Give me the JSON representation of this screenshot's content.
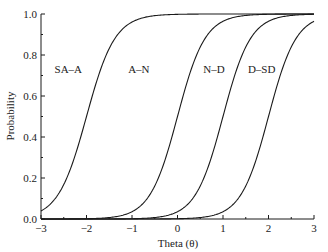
{
  "chart_data": {
    "type": "line",
    "title": "",
    "xlabel": "Theta (θ)",
    "ylabel": "Probability",
    "xlim": [
      -3,
      3
    ],
    "ylim": [
      0.0,
      1.0
    ],
    "grid": false,
    "legend": "none (inline curve labels)",
    "x_ticks": [
      "−3",
      "−2",
      "−1",
      "0",
      "1",
      "2",
      "3"
    ],
    "x_tick_values": [
      -3,
      -2,
      -1,
      0,
      1,
      2,
      3
    ],
    "y_ticks": [
      "0.0",
      "0.2",
      "0.4",
      "0.6",
      "0.8",
      "1.0"
    ],
    "y_tick_values": [
      0.0,
      0.2,
      0.4,
      0.6,
      0.8,
      1.0
    ],
    "x": [
      -3,
      -2.5,
      -2,
      -1.5,
      -1,
      -0.5,
      0,
      0.5,
      1,
      1.5,
      2,
      2.5,
      3
    ],
    "series": [
      {
        "name": "SA–A",
        "discrimination": 3.2,
        "threshold": -2.0,
        "values": [
          0.04,
          0.17,
          0.5,
          0.83,
          0.96,
          0.99,
          1.0,
          1.0,
          1.0,
          1.0,
          1.0,
          1.0,
          1.0
        ]
      },
      {
        "name": "A–N",
        "discrimination": 3.3,
        "threshold": 0.0,
        "values": [
          0.0,
          0.0,
          0.0,
          0.01,
          0.04,
          0.16,
          0.5,
          0.84,
          0.96,
          0.99,
          1.0,
          1.0,
          1.0
        ]
      },
      {
        "name": "N–D",
        "discrimination": 3.3,
        "threshold": 1.0,
        "values": [
          0.0,
          0.0,
          0.0,
          0.0,
          0.0,
          0.01,
          0.04,
          0.16,
          0.5,
          0.84,
          0.96,
          0.99,
          1.0
        ]
      },
      {
        "name": "D–SD",
        "discrimination": 3.3,
        "threshold": 2.0,
        "values": [
          0.0,
          0.0,
          0.0,
          0.0,
          0.0,
          0.0,
          0.0,
          0.01,
          0.04,
          0.16,
          0.5,
          0.84,
          0.96
        ]
      }
    ],
    "annotations": [
      {
        "text": "SA–A",
        "x": -2.4,
        "y": 0.71
      },
      {
        "text": "A–N",
        "x": -0.85,
        "y": 0.71
      },
      {
        "text": "N–D",
        "x": 0.8,
        "y": 0.71
      },
      {
        "text": "D–SD",
        "x": 1.85,
        "y": 0.71
      }
    ]
  },
  "style": {
    "line_color": "#1a1a1a",
    "axis_color": "#1a1a1a",
    "background": "#ffffff"
  }
}
